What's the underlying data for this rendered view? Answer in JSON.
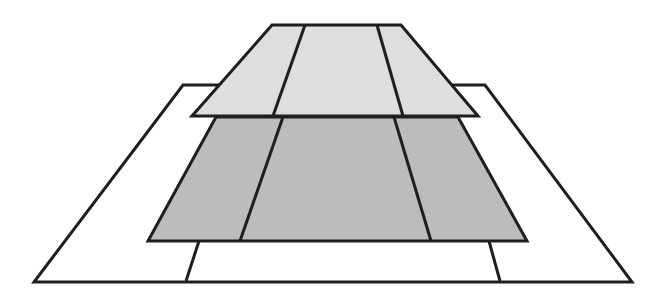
{
  "canvas": {
    "width": 667,
    "height": 305,
    "background": "#ffffff"
  },
  "colors": {
    "outline": "#1e1e1e",
    "outer_frame_fill": "#ffffff",
    "middle_layer_fill": "#bcbcbc",
    "top_layer_fill": "#dedede"
  },
  "layers": [
    {
      "name": "outer-frame",
      "fill": "#ffffff",
      "polygon": [
        [
          183,
          85
        ],
        [
          485,
          85
        ],
        [
          632,
          282
        ],
        [
          34,
          282
        ]
      ],
      "divider_lines": [
        [
          [
            199,
            241
          ],
          [
            186,
            281
          ]
        ],
        [
          [
            489,
            241
          ],
          [
            500,
            281
          ]
        ]
      ]
    },
    {
      "name": "middle-layer",
      "fill": "#bcbcbc",
      "polygon": [
        [
          216,
          117
        ],
        [
          458,
          117
        ],
        [
          527,
          241
        ],
        [
          148,
          241
        ]
      ],
      "divider_lines": [
        [
          [
            283,
            117
          ],
          [
            240,
            241
          ]
        ],
        [
          [
            394,
            117
          ],
          [
            431,
            241
          ]
        ]
      ]
    },
    {
      "name": "top-layer",
      "fill": "#dedede",
      "polygon": [
        [
          272,
          25
        ],
        [
          401,
          25
        ],
        [
          478,
          116
        ],
        [
          192,
          116
        ]
      ],
      "divider_lines": [
        [
          [
            305,
            25
          ],
          [
            273,
            116
          ]
        ],
        [
          [
            377,
            25
          ],
          [
            403,
            116
          ]
        ]
      ]
    }
  ]
}
